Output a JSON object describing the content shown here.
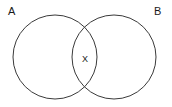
{
  "figure": {
    "type": "venn-diagram",
    "background_color": "#ffffff",
    "stroke_color": "#3a3a3a",
    "text_color": "#1a1a1a"
  },
  "sets": {
    "left": {
      "label": "A",
      "cx": 55,
      "cy": 57,
      "r": 42
    },
    "right": {
      "label": "B",
      "cx": 114,
      "cy": 57,
      "r": 42
    }
  },
  "regions": {
    "intersection": {
      "label": "X",
      "cx": 85,
      "cy": 59
    }
  }
}
